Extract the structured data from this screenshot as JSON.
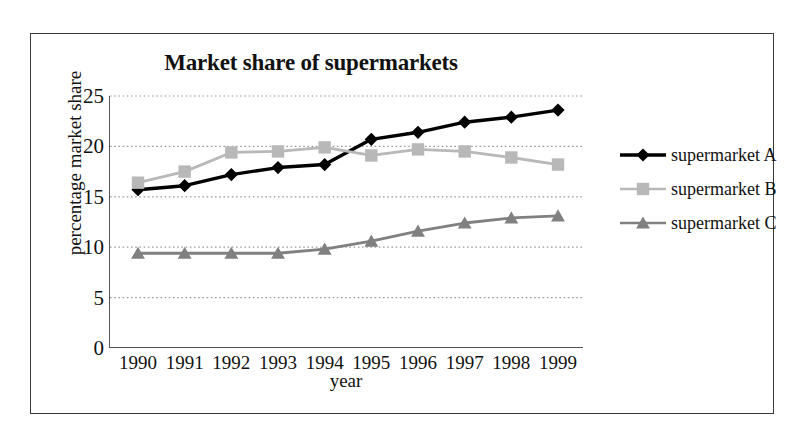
{
  "chart_data": {
    "type": "line",
    "title": "Market share of supermarkets",
    "xlabel": "year",
    "ylabel": "percentage market share",
    "categories": [
      "1990",
      "1991",
      "1992",
      "1993",
      "1994",
      "1995",
      "1996",
      "1997",
      "1998",
      "1999"
    ],
    "x": [
      1990,
      1991,
      1992,
      1993,
      1994,
      1995,
      1996,
      1997,
      1998,
      1999
    ],
    "ylim": [
      0,
      25
    ],
    "yticks": [
      0,
      5,
      10,
      15,
      20,
      25
    ],
    "ytick_labels": [
      "0",
      "5",
      "10",
      "15",
      "20",
      "25"
    ],
    "grid": "horizontal-dotted",
    "legend_position": "right",
    "series": [
      {
        "name": "supermarket A",
        "marker": "diamond",
        "color": "#000000",
        "values": [
          15.7,
          16.1,
          17.2,
          17.9,
          18.2,
          20.7,
          21.4,
          22.4,
          22.9,
          23.6
        ]
      },
      {
        "name": "supermarket B",
        "marker": "square",
        "color": "#b8b8b8",
        "values": [
          16.4,
          17.5,
          19.4,
          19.5,
          19.9,
          19.1,
          19.7,
          19.5,
          18.9,
          18.2
        ]
      },
      {
        "name": "supermarket C",
        "marker": "triangle",
        "color": "#808080",
        "values": [
          9.4,
          9.4,
          9.4,
          9.4,
          9.8,
          10.6,
          11.6,
          12.4,
          12.9,
          13.1
        ]
      }
    ]
  },
  "legend": {
    "items": [
      {
        "label": "supermarket A",
        "marker": "diamond-marker-icon",
        "color": "#000000"
      },
      {
        "label": "supermarket B",
        "marker": "square-marker-icon",
        "color": "#b8b8b8"
      },
      {
        "label": "supermarket C",
        "marker": "triangle-marker-icon",
        "color": "#808080"
      }
    ]
  },
  "colors": {
    "frame_border": "#3a3a3a",
    "axis": "#555555",
    "gridline": "#9a9a9a",
    "background": "#ffffff",
    "text": "#111111"
  }
}
